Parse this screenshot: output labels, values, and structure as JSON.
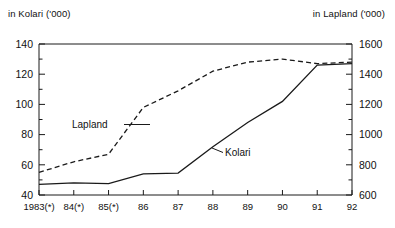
{
  "titles": {
    "left": "in Kolari ('000)",
    "right": "in Lapland ('000)"
  },
  "labels": {
    "kolari": "Kolari",
    "lapland": "Lapland"
  },
  "axes": {
    "left_ticks": [
      "40",
      "60",
      "80",
      "100",
      "120",
      "140"
    ],
    "right_ticks": [
      "600",
      "800",
      "1000",
      "1200",
      "1400",
      "1600"
    ],
    "x_ticks": [
      "1983(*)",
      "84(*)",
      "85(*)",
      "86",
      "87",
      "88",
      "89",
      "90",
      "91",
      "92"
    ]
  },
  "chart_data": {
    "type": "line",
    "title": "",
    "xlabel": "",
    "ylabel": "in Kolari ('000)",
    "y2label": "in Lapland ('000)",
    "grid": false,
    "legend": "inline-annotations",
    "x": [
      "1983(*)",
      "84(*)",
      "85(*)",
      "86",
      "87",
      "88",
      "89",
      "90",
      "91",
      "92"
    ],
    "ylim": [
      40,
      140
    ],
    "y2lim": [
      600,
      1600
    ],
    "y_tick_step": 20,
    "y_minor_tick_step": 10,
    "y2_tick_step": 200,
    "y2_minor_tick_step": 100,
    "series": [
      {
        "name": "Kolari",
        "axis": "left",
        "style": "solid",
        "color": "#1a1a1a",
        "values": [
          47,
          48,
          47.5,
          54,
          54.5,
          72,
          88,
          102,
          126,
          127
        ]
      },
      {
        "name": "Lapland",
        "axis": "right",
        "style": "dashed",
        "color": "#1a1a1a",
        "values": [
          750,
          820,
          870,
          1180,
          1290,
          1420,
          1480,
          1500,
          1470,
          1480
        ]
      }
    ]
  }
}
